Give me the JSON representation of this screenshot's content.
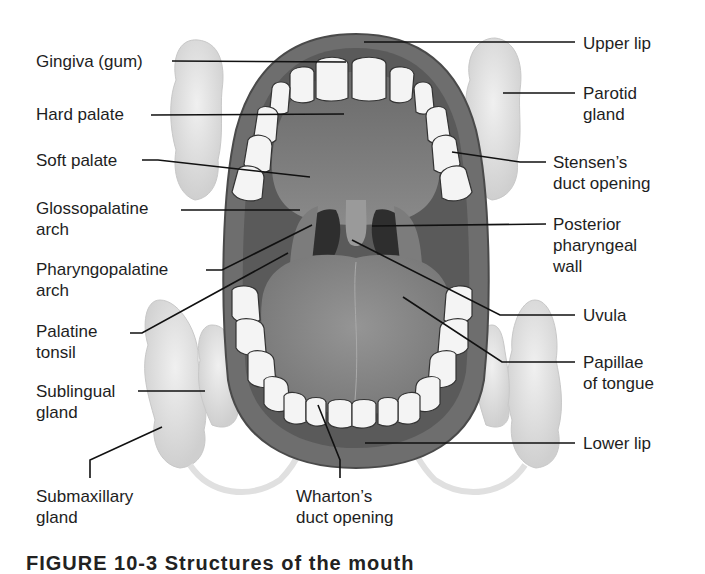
{
  "diagram": {
    "title": "Structures of the mouth",
    "labels": {
      "gingiva": "Gingiva (gum)",
      "hard_palate": "Hard palate",
      "soft_palate": "Soft palate",
      "glossopalatine_arch": "Glossopalatine\narch",
      "pharyngopalatine_arch": "Pharyngopalatine\narch",
      "palatine_tonsil": "Palatine\ntonsil",
      "sublingual_gland": "Sublingual\ngland",
      "submaxillary_gland": "Submaxillary\ngland",
      "whartons_duct": "Wharton’s\nduct opening",
      "upper_lip": "Upper lip",
      "parotid_gland": "Parotid\ngland",
      "stensens_duct": "Stensen’s\nduct opening",
      "posterior_pharyngeal_wall": "Posterior\npharyngeal\nwall",
      "uvula": "Uvula",
      "papillae": "Papillae\nof tongue",
      "lower_lip": "Lower lip"
    },
    "caption": "FIGURE 10-3  Structures of the mouth"
  },
  "colors": {
    "background": "#ffffff",
    "lip": "#6e6e6e",
    "lip_dark": "#4e4e4e",
    "oral_cavity": "#5a5a5a",
    "palate": "#7a7a7a",
    "tongue": "#8a8a8a",
    "throat": "#2e2e2e",
    "teeth": "#f4f4f4",
    "gland": "#dcdcdc",
    "leader_line": "#111111",
    "text": "#1e1e1e"
  }
}
